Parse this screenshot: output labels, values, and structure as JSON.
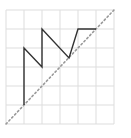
{
  "figure": {
    "type": "step-path-over-grid",
    "grid": {
      "cols": 6,
      "rows": 6,
      "x0": 6,
      "y0": 10,
      "x1": 114,
      "y1": 124,
      "color": "#dddddd"
    },
    "diagonal": {
      "from": [
        6,
        124
      ],
      "to": [
        114,
        10
      ],
      "color": "#999999",
      "style": "dotted"
    },
    "path": {
      "color": "#333333",
      "points": [
        [
          24,
          105
        ],
        [
          24,
          48
        ],
        [
          42,
          67
        ],
        [
          42,
          29
        ],
        [
          69,
          58
        ],
        [
          78,
          29
        ],
        [
          96,
          29
        ]
      ]
    }
  }
}
